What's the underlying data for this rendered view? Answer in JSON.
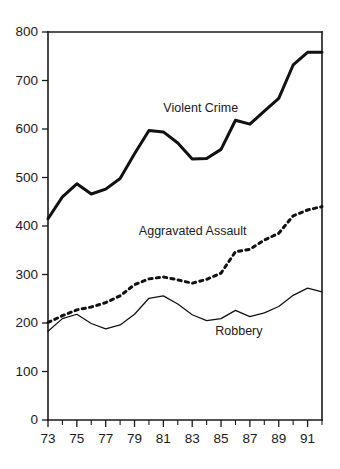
{
  "chart_data": {
    "type": "line",
    "title": "",
    "subtitle": "",
    "xlabel": "",
    "ylabel": "",
    "xlim": [
      73,
      92
    ],
    "ylim": [
      0,
      800
    ],
    "grid": false,
    "legend_position": "inline-annotations",
    "x": [
      73,
      74,
      75,
      76,
      77,
      78,
      79,
      80,
      81,
      82,
      83,
      84,
      85,
      86,
      87,
      88,
      89,
      90,
      91,
      92
    ],
    "x_tick_labels": [
      "73",
      "74",
      "75",
      "76",
      "77",
      "78",
      "79",
      "80",
      "81",
      "82",
      "83",
      "84",
      "85",
      "86",
      "87",
      "88",
      "89",
      "90",
      "91",
      "92"
    ],
    "x_labeled_ticks": [
      "73",
      "75",
      "77",
      "79",
      "81",
      "83",
      "85",
      "87",
      "89",
      "91"
    ],
    "y_tick_labels": [
      "0",
      "100",
      "200",
      "300",
      "400",
      "500",
      "600",
      "700",
      "800"
    ],
    "y_ticks": [
      0,
      100,
      200,
      300,
      400,
      500,
      600,
      700,
      800
    ],
    "series": [
      {
        "name": "Violent Crime",
        "style": "thick-solid",
        "color": "#111111",
        "label_x": 81.0,
        "label_y": 642,
        "values": [
          415,
          460,
          487,
          466,
          476,
          498,
          549,
          597,
          594,
          571,
          538,
          539,
          558,
          618,
          610,
          637,
          663,
          732,
          758,
          758
        ]
      },
      {
        "name": "Aggravated Assault",
        "style": "thick-dotted",
        "color": "#111111",
        "label_x": 79.3,
        "label_y": 389,
        "values": [
          201,
          215,
          227,
          233,
          242,
          256,
          279,
          291,
          295,
          289,
          282,
          290,
          303,
          347,
          352,
          371,
          385,
          421,
          433,
          440
        ]
      },
      {
        "name": "Robbery",
        "style": "thin-solid",
        "color": "#111111",
        "label_x": 84.6,
        "label_y": 182,
        "values": [
          183,
          209,
          218,
          199,
          188,
          196,
          218,
          251,
          256,
          239,
          217,
          205,
          209,
          226,
          213,
          221,
          234,
          257,
          272,
          264
        ]
      }
    ]
  },
  "geometry": {
    "plot_left": 48,
    "plot_right": 322,
    "plot_top": 32,
    "plot_bottom": 420,
    "y_axis_top_value": 800,
    "y_axis_bottom_value": 0,
    "x_axis_left_value": 73,
    "x_axis_right_value": 92
  }
}
